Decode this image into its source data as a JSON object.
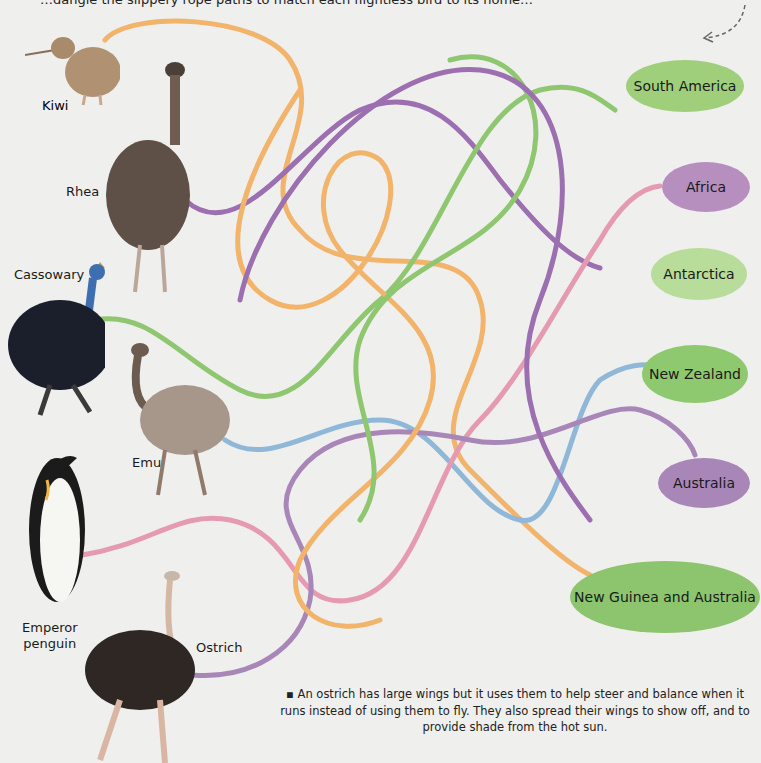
{
  "header": {
    "instructions_partial": "…dangle the slippery rope paths to match each flightless bird to its home…"
  },
  "birds": [
    {
      "name": "Kiwi",
      "color": "#a88b6a"
    },
    {
      "name": "Rhea",
      "color": "#6f5e4f"
    },
    {
      "name": "Cassowary",
      "color": "#1e2a3a"
    },
    {
      "name": "Emu",
      "color": "#8a7766"
    },
    {
      "name": "Emperor penguin",
      "line1": "Emperor",
      "line2": "penguin",
      "color": "#1b1b1b"
    },
    {
      "name": "Ostrich",
      "color": "#3a2e2a"
    }
  ],
  "destinations": [
    {
      "label": "South America",
      "color": "#9fcf7a"
    },
    {
      "label": "Africa",
      "color": "#b78fbe"
    },
    {
      "label": "Antarctica",
      "color": "#b8dc9a"
    },
    {
      "label": "New Zealand",
      "color": "#8fc96f"
    },
    {
      "label": "Australia",
      "color": "#a887b8"
    },
    {
      "label": "New Guinea and Australia",
      "color": "#8cc56d"
    }
  ],
  "path_colors": {
    "orange": "#f2b36b",
    "purple": "#9c6fb0",
    "green": "#8fc670",
    "blue": "#8fb8d8",
    "pink": "#e69ab1"
  },
  "fact": {
    "bullet": "▪",
    "text": "An ostrich has large wings but it uses them to help steer and balance when it runs instead of using them to fly. They also spread their wings to show off, and to provide shade from the hot sun."
  }
}
